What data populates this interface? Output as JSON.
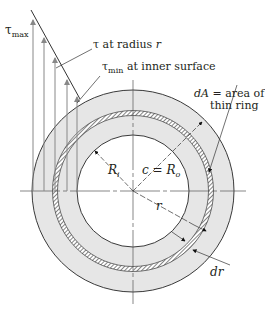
{
  "figure": {
    "tau_max": {
      "sym": "τ",
      "sub": "max"
    },
    "tau_at_r": {
      "sym": "τ",
      "text": " at radius ",
      "var": "r"
    },
    "tau_min": {
      "sym": "τ",
      "sub": "min",
      "text": " at inner surface"
    },
    "dA": {
      "var": "dA",
      "text1": " = area of a",
      "text2": "thin ring"
    },
    "R_i": {
      "var": "R",
      "sub": "i"
    },
    "c_Ro": {
      "var1": "c",
      "eq": " = ",
      "var2": "R",
      "sub": "o"
    },
    "r": {
      "var": "r"
    },
    "dr": {
      "var": "dr"
    }
  },
  "colors": {
    "ring_fill": "#e6e6e6",
    "line": "#3a3a3a",
    "arrow_gray": "#8a8a8a"
  }
}
